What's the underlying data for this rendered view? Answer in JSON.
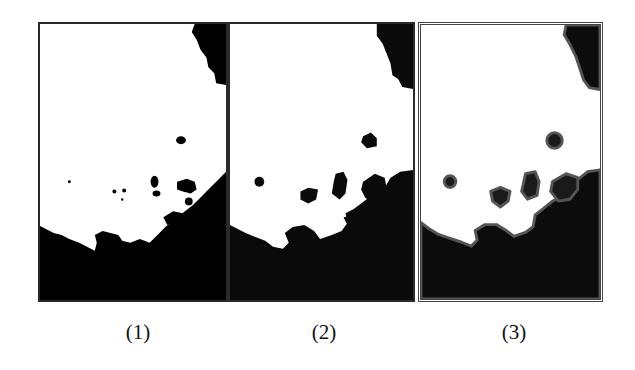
{
  "figure": {
    "panels": [
      {
        "label": "(1)",
        "description": "binary mask, thin noisy edges"
      },
      {
        "label": "(2)",
        "description": "binary mask after dilation, blocky regions"
      },
      {
        "label": "(3)",
        "description": "smoothed mask with gray halo edges"
      }
    ],
    "colors": {
      "foreground": "#ffffff",
      "background": "#000000",
      "halo": "#3a3a3a",
      "border": "#2a2a2a"
    }
  }
}
